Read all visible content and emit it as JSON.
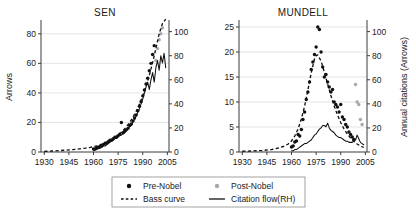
{
  "figure": {
    "width": 416,
    "height": 213,
    "background": "#ffffff"
  },
  "legend": {
    "position": "bottom-center",
    "entries": [
      {
        "label": "Pre-Nobel",
        "marker": "filled-circle",
        "color": "#101010"
      },
      {
        "label": "Post-Nobel",
        "marker": "filled-circle",
        "color": "#a8a8a8"
      },
      {
        "label": "Bass curve",
        "marker": "dashed-line",
        "color": "#111111"
      },
      {
        "label": "Citation flow(RH)",
        "marker": "solid-line",
        "color": "#111111"
      }
    ]
  },
  "chart_data": [
    {
      "type": "scatter",
      "title": "SEN",
      "xlabel": "",
      "ylabel": "Arrows",
      "y2label": "",
      "xlim": [
        1928,
        2006
      ],
      "ylim": [
        0,
        88
      ],
      "y2lim": [
        0,
        108
      ],
      "xticks": [
        1930,
        1945,
        1960,
        1975,
        1990,
        2005
      ],
      "yticks": [
        0,
        20,
        40,
        60,
        80
      ],
      "y2ticks": [
        0,
        20,
        40,
        60,
        80,
        100
      ],
      "grid": true,
      "series": [
        {
          "name": "Pre-Nobel",
          "type": "scatter",
          "color": "#101010",
          "axis": "left",
          "x": [
            1960,
            1961,
            1962,
            1963,
            1964,
            1965,
            1966,
            1967,
            1968,
            1969,
            1970,
            1971,
            1972,
            1973,
            1974,
            1975,
            1976,
            1977,
            1978,
            1979,
            1980,
            1981,
            1982,
            1983,
            1984,
            1985,
            1986,
            1987,
            1988,
            1989,
            1990,
            1991,
            1992,
            1993,
            1994,
            1995,
            1996,
            1997
          ],
          "y": [
            2,
            2,
            3,
            3,
            4,
            4,
            5,
            6,
            6,
            7,
            8,
            8,
            9,
            10,
            10,
            11,
            12,
            20,
            13,
            14,
            15,
            16,
            18,
            19,
            21,
            23,
            25,
            28,
            31,
            34,
            38,
            42,
            46,
            50,
            55,
            60,
            66,
            72
          ]
        },
        {
          "name": "Post-Nobel",
          "type": "scatter",
          "color": "#a8a8a8",
          "axis": "left",
          "x": [
            1998,
            1999,
            2000,
            2001,
            2002
          ],
          "y": [
            62,
            70,
            76,
            80,
            84
          ]
        },
        {
          "name": "Bass curve",
          "type": "line",
          "style": "dashed",
          "color": "#111111",
          "axis": "left",
          "x": [
            1930,
            1935,
            1940,
            1945,
            1950,
            1955,
            1958,
            1960,
            1962,
            1964,
            1966,
            1968,
            1970,
            1972,
            1974,
            1976,
            1978,
            1980,
            1982,
            1984,
            1986,
            1988,
            1990,
            1992,
            1994,
            1996,
            1998,
            2000,
            2002,
            2004
          ],
          "y": [
            0.4,
            0.7,
            1.0,
            1.4,
            1.9,
            2.6,
            3.1,
            3.6,
            4.2,
            4.9,
            5.7,
            6.7,
            7.8,
            9.1,
            10.6,
            12.4,
            14.5,
            17.0,
            20.0,
            23.5,
            27.6,
            32.4,
            38.0,
            44.5,
            52.0,
            60.5,
            70.0,
            80.0,
            87.0,
            90.0
          ]
        },
        {
          "name": "Citation flow(RH)",
          "type": "line",
          "style": "solid",
          "color": "#111111",
          "axis": "right",
          "x": [
            1960,
            1961,
            1962,
            1963,
            1964,
            1965,
            1966,
            1967,
            1968,
            1969,
            1970,
            1971,
            1972,
            1973,
            1974,
            1975,
            1976,
            1977,
            1978,
            1979,
            1980,
            1981,
            1982,
            1983,
            1984,
            1985,
            1986,
            1987,
            1988,
            1989,
            1990,
            1991,
            1992,
            1993,
            1994,
            1995,
            1996,
            1997,
            1998,
            1999,
            2000,
            2001,
            2002,
            2003,
            2004
          ],
          "y": [
            1,
            2,
            2,
            3,
            3,
            4,
            5,
            5,
            6,
            7,
            8,
            9,
            10,
            11,
            12,
            13,
            14,
            14,
            15,
            16,
            18,
            19,
            21,
            22,
            25,
            27,
            30,
            33,
            36,
            40,
            44,
            49,
            54,
            58,
            52,
            60,
            66,
            58,
            70,
            76,
            68,
            80,
            74,
            82,
            70
          ]
        }
      ]
    },
    {
      "type": "scatter",
      "title": "MUNDELL",
      "xlabel": "",
      "ylabel": "",
      "y2label": "Annual citations (Arrows)",
      "xlim": [
        1928,
        2006
      ],
      "ylim": [
        0,
        26
      ],
      "y2lim": [
        0,
        108
      ],
      "xticks": [
        1930,
        1945,
        1960,
        1975,
        1990,
        2005
      ],
      "yticks": [
        0,
        5,
        10,
        15,
        20,
        25
      ],
      "y2ticks": [
        0,
        20,
        40,
        60,
        80,
        100
      ],
      "grid": true,
      "series": [
        {
          "name": "Pre-Nobel",
          "type": "scatter",
          "color": "#101010",
          "axis": "left",
          "x": [
            1960,
            1961,
            1962,
            1963,
            1964,
            1965,
            1966,
            1967,
            1968,
            1969,
            1970,
            1971,
            1972,
            1973,
            1974,
            1975,
            1976,
            1977,
            1978,
            1979,
            1980,
            1981,
            1982,
            1983,
            1984,
            1985,
            1986,
            1987,
            1988,
            1989,
            1990,
            1991,
            1992,
            1993,
            1994,
            1995,
            1996,
            1997,
            1998
          ],
          "y": [
            1.0,
            1.2,
            2.0,
            2.2,
            3.5,
            3.2,
            4.5,
            6.5,
            8.0,
            10.5,
            12.0,
            14.0,
            16.5,
            18.0,
            19.5,
            21.0,
            25.0,
            24.5,
            20.0,
            17.0,
            15.0,
            15.5,
            14.0,
            13.0,
            12.0,
            12.5,
            10.0,
            9.5,
            9.0,
            8.0,
            9.5,
            7.0,
            6.5,
            5.5,
            5.0,
            4.0,
            3.5,
            3.0,
            2.5
          ]
        },
        {
          "name": "Post-Nobel",
          "type": "scatter",
          "color": "#a8a8a8",
          "axis": "left",
          "x": [
            1999,
            2000,
            2001,
            2002,
            2003
          ],
          "y": [
            13.5,
            10.0,
            9.5,
            6.5,
            5.5
          ]
        },
        {
          "name": "Bass curve",
          "type": "line",
          "style": "dashed",
          "color": "#111111",
          "axis": "left",
          "x": [
            1930,
            1936,
            1942,
            1948,
            1952,
            1955,
            1958,
            1960,
            1962,
            1964,
            1966,
            1968,
            1970,
            1972,
            1974,
            1975,
            1976,
            1978,
            1980,
            1982,
            1984,
            1986,
            1988,
            1990,
            1992,
            1994,
            1996,
            1998,
            2000,
            2002,
            2004
          ],
          "y": [
            0.15,
            0.2,
            0.3,
            0.5,
            0.8,
            1.1,
            1.6,
            2.2,
            3.2,
            4.6,
            6.6,
            9.2,
            12.4,
            15.8,
            18.6,
            19.3,
            19.4,
            18.2,
            16.0,
            13.6,
            11.3,
            9.2,
            7.4,
            5.9,
            4.6,
            3.6,
            2.8,
            2.1,
            1.6,
            1.2,
            0.9
          ]
        },
        {
          "name": "Citation flow(RH)",
          "type": "line",
          "style": "solid",
          "color": "#111111",
          "axis": "right",
          "x": [
            1960,
            1961,
            1962,
            1963,
            1964,
            1965,
            1966,
            1967,
            1968,
            1969,
            1970,
            1971,
            1972,
            1973,
            1974,
            1975,
            1976,
            1977,
            1978,
            1979,
            1980,
            1981,
            1982,
            1983,
            1984,
            1985,
            1986,
            1987,
            1988,
            1989,
            1990,
            1991,
            1992,
            1993,
            1994,
            1995,
            1996,
            1997,
            1998,
            1999,
            2000,
            2001,
            2002,
            2003,
            2004
          ],
          "y": [
            1,
            1,
            2,
            2,
            3,
            4,
            5,
            6,
            7,
            7,
            8,
            9,
            10,
            12,
            14,
            15,
            17,
            19,
            20,
            22,
            22,
            21,
            24,
            20,
            18,
            17,
            16,
            14,
            13,
            12,
            12,
            11,
            10,
            9,
            9,
            8,
            8,
            8,
            9,
            10,
            14,
            11,
            8,
            7,
            6
          ]
        }
      ]
    }
  ]
}
